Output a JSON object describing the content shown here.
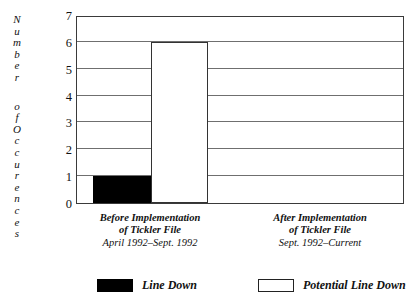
{
  "chart_data": {
    "type": "bar",
    "title": "",
    "subtitle": "",
    "xlabel": "",
    "ylabel": "Number of Occurences",
    "ylim": [
      0,
      7
    ],
    "yticks": [
      "0",
      "1",
      "2",
      "3",
      "4",
      "5",
      "6",
      "7"
    ],
    "grid": true,
    "legend_position": "bottom",
    "categories": [
      {
        "main": "Before Implementation",
        "main_line2": "of Tickler File",
        "sub": "April 1992–Sept. 1992"
      },
      {
        "main": "After Implementation",
        "main_line2": "of Tickler File",
        "sub": "Sept. 1992–Current"
      }
    ],
    "series": [
      {
        "name": "Line Down",
        "style": "filled",
        "color": "#000000",
        "values": [
          1,
          0
        ]
      },
      {
        "name": "Potential Line Down",
        "style": "hollow",
        "color": "#ffffff",
        "values": [
          6,
          0
        ]
      }
    ]
  },
  "axis": {
    "y_title_letters": [
      "N",
      "u",
      "m",
      "b",
      "e",
      "r",
      "",
      "o",
      "f",
      "O",
      "c",
      "c",
      "u",
      "r",
      "e",
      "n",
      "c",
      "e",
      "s"
    ]
  },
  "legend": {
    "items": [
      {
        "label": "Line Down",
        "swatch": "filled"
      },
      {
        "label": "Potential Line Down",
        "swatch": "hollow"
      }
    ]
  },
  "colors": {
    "frame": "#3a3a3a",
    "gridline": "#6f6f6f",
    "bar_filled": "#000000",
    "bar_hollow_fill": "#ffffff",
    "bar_hollow_border": "#333333",
    "background": "#ffffff",
    "text": "#111111"
  }
}
